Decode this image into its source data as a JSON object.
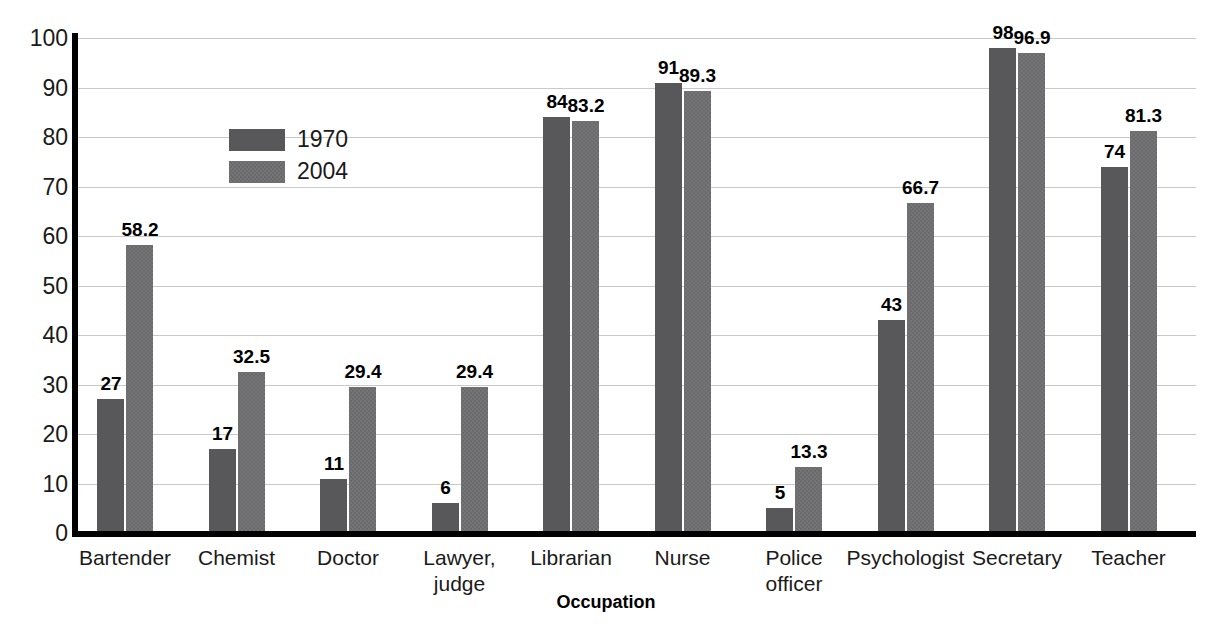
{
  "chart_data": {
    "type": "bar",
    "title": "",
    "xlabel": "Occupation",
    "ylabel": "Percentage",
    "ylim": [
      0,
      100
    ],
    "ytick_step": 10,
    "yticks": [
      "100",
      "90",
      "80",
      "70",
      "60",
      "50",
      "40",
      "30",
      "20",
      "10",
      "0"
    ],
    "grid": true,
    "legend_position": "upper-left-inside",
    "categories": [
      "Bartender",
      "Chemist",
      "Doctor",
      "Lawyer,\njudge",
      "Librarian",
      "Nurse",
      "Police\nofficer",
      "Psychologist",
      "Secretary",
      "Teacher"
    ],
    "series": [
      {
        "name": "1970",
        "color": "#58585a",
        "values": [
          27,
          17,
          11,
          6,
          84,
          91,
          5,
          43,
          98,
          74
        ],
        "labels": [
          "27",
          "17",
          "11",
          "6",
          "84",
          "91",
          "5",
          "43",
          "98",
          "74"
        ]
      },
      {
        "name": "2004",
        "color": "#757577",
        "values": [
          58.2,
          32.5,
          29.4,
          29.4,
          83.2,
          89.3,
          13.3,
          66.7,
          96.9,
          81.3
        ],
        "labels": [
          "58.2",
          "32.5",
          "29.4",
          "29.4",
          "83.2",
          "89.3",
          "13.3",
          "66.7",
          "96.9",
          "81.3"
        ]
      }
    ]
  }
}
